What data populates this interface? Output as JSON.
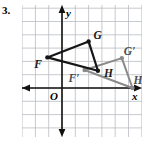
{
  "problem": {
    "number": "3."
  },
  "axes": {
    "x_label": "x",
    "y_label": "y",
    "origin_label": "O",
    "grid_color": "#b9bcc2",
    "axis_color": "#111111",
    "grid_spacing": 13.3,
    "x_range": [
      -3,
      6
    ],
    "y_range": [
      -4,
      6
    ]
  },
  "figures": {
    "preimage": {
      "name": "triangle-FGH",
      "color": "#151515",
      "vertices": [
        {
          "label": "F",
          "x": -1.1,
          "y": 2.3,
          "label_dx": -13,
          "label_dy": 11
        },
        {
          "label": "G",
          "x": 2.0,
          "y": 3.5,
          "label_dx": 5,
          "label_dy": -2
        },
        {
          "label": "H",
          "x": 2.7,
          "y": 1.3,
          "label_dx": 6,
          "label_dy": 6
        }
      ]
    },
    "image": {
      "name": "triangle-F-prime-G-prime-H-prime",
      "color": "#8a8a8a",
      "vertices": [
        {
          "label": "F′",
          "x": 1.7,
          "y": 1.35,
          "label_dx": -16,
          "label_dy": 12
        },
        {
          "label": "G′",
          "x": 4.5,
          "y": 2.25,
          "label_dx": 2,
          "label_dy": -3
        },
        {
          "label": "H′",
          "x": 5.3,
          "y": 0.0,
          "label_dx": 1,
          "label_dy": -4
        }
      ]
    }
  }
}
